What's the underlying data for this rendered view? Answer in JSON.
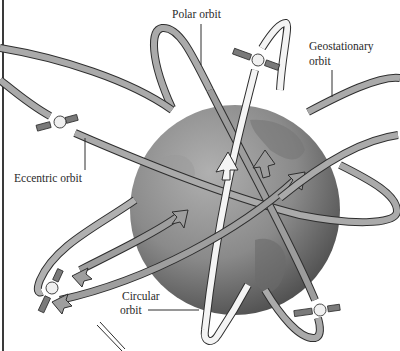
{
  "diagram": {
    "labels": {
      "polar": "Polar orbit",
      "geostationary_line1": "Geostationary",
      "geostationary_line2": "orbit",
      "eccentric": "Eccentric orbit",
      "circular_line1": "Circular",
      "circular_line2": "orbit"
    },
    "colors": {
      "background": "#ffffff",
      "earth_light": "#a8a8a8",
      "earth_dark": "#4a4a4a",
      "orbit_band": "#a9a9a9",
      "orbit_band_light": "#f2f2f2",
      "outline": "#2e2e2e",
      "label_text": "#2a2a2a"
    },
    "elements": [
      {
        "id": "earth",
        "kind": "globe"
      },
      {
        "id": "polar-orbit",
        "kind": "orbit-band",
        "label": "Polar orbit"
      },
      {
        "id": "geostationary-orbit",
        "kind": "orbit-band",
        "label": "Geostationary orbit"
      },
      {
        "id": "eccentric-orbit",
        "kind": "orbit-band",
        "label": "Eccentric orbit"
      },
      {
        "id": "circular-orbit",
        "kind": "orbit-band",
        "label": "Circular orbit"
      },
      {
        "id": "satellite-top",
        "kind": "satellite"
      },
      {
        "id": "satellite-left",
        "kind": "satellite"
      },
      {
        "id": "satellite-bottom-left",
        "kind": "satellite"
      },
      {
        "id": "satellite-bottom-right",
        "kind": "satellite"
      }
    ]
  }
}
